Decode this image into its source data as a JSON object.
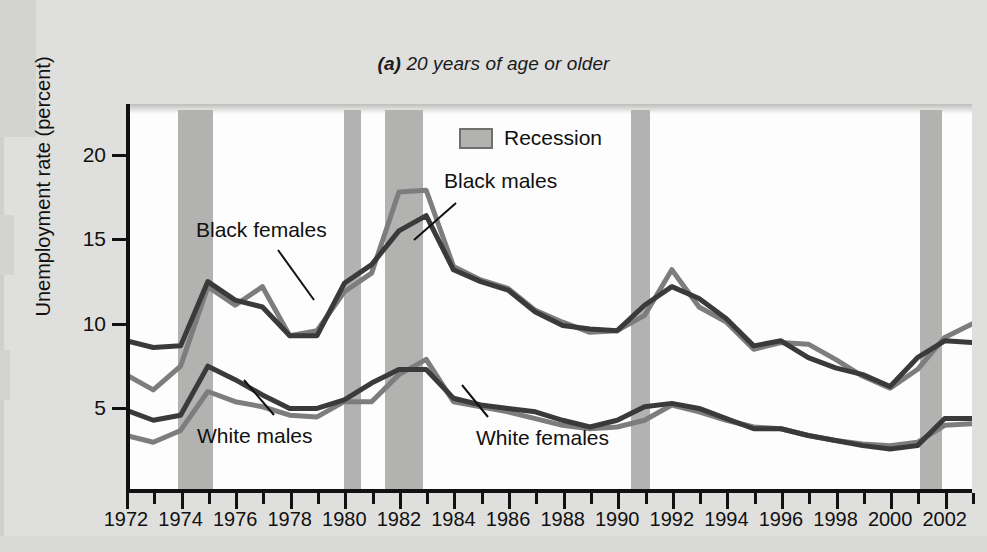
{
  "chart_data": {
    "type": "line",
    "title": "(a) 20 years of age or older",
    "title_prefix": "(a)",
    "title_rest": " 20 years of age or older",
    "xlabel": "",
    "ylabel": "Unemployment rate (percent)",
    "xlim": [
      1972,
      2003
    ],
    "ylim": [
      0,
      23
    ],
    "grid": false,
    "legend_position": "top-center",
    "legend": [
      {
        "label": "Recession",
        "color": "#b2b2b0",
        "type": "band"
      }
    ],
    "ytick_labels": [
      "5",
      "10",
      "15",
      "20"
    ],
    "ytick_values": [
      5,
      10,
      15,
      20
    ],
    "xtick_labels": [
      "1972",
      "1974",
      "1976",
      "1978",
      "1980",
      "1982",
      "1984",
      "1986",
      "1988",
      "1990",
      "1992",
      "1994",
      "1996",
      "1998",
      "2000",
      "2002"
    ],
    "xtick_values": [
      1972,
      1974,
      1976,
      1978,
      1980,
      1982,
      1984,
      1986,
      1988,
      1990,
      1992,
      1994,
      1996,
      1998,
      2000,
      2002
    ],
    "x": [
      1972,
      1973,
      1974,
      1975,
      1976,
      1977,
      1978,
      1979,
      1980,
      1981,
      1982,
      1983,
      1984,
      1985,
      1986,
      1987,
      1988,
      1989,
      1990,
      1991,
      1992,
      1993,
      1994,
      1995,
      1996,
      1997,
      1998,
      1999,
      2000,
      2001,
      2002,
      2003
    ],
    "series": [
      {
        "name": "Black males",
        "color": "#3a3a3a",
        "annotation": "Black males",
        "values": [
          9.0,
          8.6,
          8.7,
          12.5,
          11.4,
          11.0,
          9.3,
          9.3,
          12.4,
          13.5,
          15.5,
          16.4,
          13.2,
          12.5,
          12.0,
          10.7,
          9.9,
          9.7,
          9.6,
          11.1,
          12.2,
          11.5,
          10.3,
          8.7,
          9.0,
          8.0,
          7.4,
          7.0,
          6.3,
          8.0,
          9.0,
          8.9
        ]
      },
      {
        "name": "Black females",
        "color": "#7d7d7d",
        "annotation": "Black females",
        "values": [
          7.0,
          6.1,
          7.5,
          12.2,
          11.1,
          12.2,
          9.3,
          9.6,
          11.9,
          13.0,
          17.8,
          17.9,
          13.4,
          12.6,
          12.1,
          10.8,
          10.1,
          9.5,
          9.6,
          10.5,
          13.2,
          11.0,
          10.1,
          8.5,
          8.9,
          8.8,
          7.9,
          6.9,
          6.2,
          7.3,
          9.2,
          10.0
        ]
      },
      {
        "name": "White males",
        "color": "#3a3a3a",
        "annotation": "White males",
        "values": [
          4.9,
          4.3,
          4.6,
          7.5,
          6.7,
          5.8,
          5.0,
          5.0,
          5.5,
          6.5,
          7.3,
          7.3,
          5.6,
          5.2,
          5.0,
          4.8,
          4.3,
          3.9,
          4.3,
          5.1,
          5.3,
          5.0,
          4.4,
          3.8,
          3.8,
          3.4,
          3.1,
          2.8,
          2.6,
          2.8,
          4.4,
          4.4
        ]
      },
      {
        "name": "White females",
        "color": "#7d7d7d",
        "annotation": "White females",
        "values": [
          3.4,
          3.0,
          3.7,
          6.0,
          5.4,
          5.1,
          4.6,
          4.5,
          5.4,
          5.4,
          7.0,
          7.9,
          5.4,
          5.1,
          4.8,
          4.4,
          4.0,
          3.8,
          3.9,
          4.3,
          5.2,
          4.8,
          4.3,
          3.9,
          3.8,
          3.4,
          3.1,
          2.9,
          2.8,
          3.0,
          4.0,
          4.1
        ]
      }
    ],
    "recessions": [
      {
        "start": 1973.9,
        "end": 1975.2
      },
      {
        "start": 1980.0,
        "end": 1980.6
      },
      {
        "start": 1981.5,
        "end": 1982.9
      },
      {
        "start": 1990.5,
        "end": 1991.2
      },
      {
        "start": 2001.1,
        "end": 2001.9
      }
    ]
  }
}
